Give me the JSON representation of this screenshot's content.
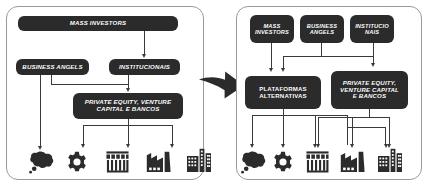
{
  "diagram": {
    "type": "flow-diagram",
    "panels": [
      {
        "id": "left",
        "name": "traditional-model",
        "nodes": [
          {
            "id": "mass-investors",
            "label": "MASS INVESTORS",
            "lines": [
              "MASS INVESTORS"
            ]
          },
          {
            "id": "business-angels",
            "label": "BUSINESS ANGELS",
            "lines": [
              "BUSINESS ANGELS"
            ]
          },
          {
            "id": "institucionais",
            "label": "INSTITUCIONAIS",
            "lines": [
              "INSTITUCIONAIS"
            ]
          },
          {
            "id": "private-equity",
            "label": "PRIVATE EQUITY, VENTURE CAPITAL E BANCOS",
            "lines": [
              "PRIVATE EQUITY, VENTURE",
              "CAPITAL E BANCOS"
            ]
          }
        ],
        "icons": [
          {
            "id": "idea",
            "name": "thought-cloud-icon"
          },
          {
            "id": "gear",
            "name": "gear-icon"
          },
          {
            "id": "shop",
            "name": "shop-icon"
          },
          {
            "id": "factory",
            "name": "factory-icon"
          },
          {
            "id": "buildings",
            "name": "buildings-icon"
          }
        ],
        "flows": [
          {
            "from": "mass-investors",
            "to": "institucionais"
          },
          {
            "from": "business-angels",
            "to": "private-equity"
          },
          {
            "from": "business-angels",
            "to": "idea"
          },
          {
            "from": "institucionais",
            "to": "private-equity"
          },
          {
            "from": "private-equity",
            "to": "shop"
          },
          {
            "from": "private-equity",
            "to": "factory"
          },
          {
            "from": "private-equity",
            "to": "buildings"
          }
        ]
      },
      {
        "id": "right",
        "name": "alternative-platforms-model",
        "nodes": [
          {
            "id": "mass-investors",
            "label": "MASS INVESTORS",
            "lines": [
              "MASS",
              "INVESTORS"
            ]
          },
          {
            "id": "business-angels",
            "label": "BUSINESS ANGELS",
            "lines": [
              "BUSINESS",
              "ANGELS"
            ]
          },
          {
            "id": "institucionais",
            "label": "INSTITUCIONAIS",
            "lines": [
              "INSTITUCIO",
              "NAIS"
            ]
          },
          {
            "id": "plataformas",
            "label": "PLATAFORMAS ALTERNATIVAS",
            "lines": [
              "PLATAFORMAS",
              "ALTERNATIVAS"
            ]
          },
          {
            "id": "private-equity",
            "label": "PRIVATE EQUITY, VENTURE CAPITAL E BANCOS",
            "lines": [
              "PRIVATE EQUITY,",
              "VENTURE CAPITAL",
              "E BANCOS"
            ]
          }
        ],
        "icons": [
          {
            "id": "idea",
            "name": "thought-cloud-icon"
          },
          {
            "id": "gear",
            "name": "gear-icon"
          },
          {
            "id": "shop",
            "name": "shop-icon"
          },
          {
            "id": "factory",
            "name": "factory-icon"
          },
          {
            "id": "buildings",
            "name": "buildings-icon"
          }
        ],
        "flows": [
          {
            "from": "mass-investors",
            "to": "plataformas"
          },
          {
            "from": "business-angels",
            "to": "plataformas"
          },
          {
            "from": "business-angels",
            "to": "private-equity"
          },
          {
            "from": "institucionais",
            "to": "private-equity"
          },
          {
            "from": "plataformas",
            "to": "idea"
          },
          {
            "from": "plataformas",
            "to": "gear"
          },
          {
            "from": "plataformas",
            "to": "shop"
          },
          {
            "from": "plataformas",
            "to": "buildings"
          },
          {
            "from": "private-equity",
            "to": "shop"
          },
          {
            "from": "private-equity",
            "to": "factory"
          },
          {
            "from": "private-equity",
            "to": "buildings"
          }
        ]
      }
    ],
    "transition_arrow": {
      "name": "right-arrow",
      "direction": "right"
    },
    "colors": {
      "node_fill": "#2b2b2b",
      "node_text": "#ffffff",
      "connector": "#3a3a3a",
      "panel_border": "#9a9a9a",
      "background": "#ffffff",
      "icon": "#2b2b2b"
    }
  }
}
